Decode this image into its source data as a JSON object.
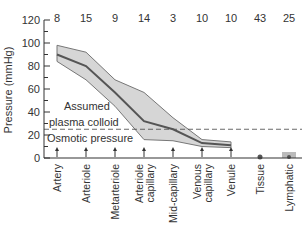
{
  "chart_data": {
    "type": "area",
    "title": "",
    "xlabel": "",
    "ylabel": "Pressure (mmHg)",
    "ylim": [
      0,
      120
    ],
    "yticks": [
      0,
      20,
      40,
      60,
      80,
      100,
      120
    ],
    "grid": false,
    "categories": [
      "Artery",
      "Arteriole",
      "Metarteriole",
      "Arteriole capillary",
      "Mid-capillary",
      "Venous capillary",
      "Venule",
      "Tissue",
      "Lymphatic"
    ],
    "top_labels": [
      "8",
      "15",
      "9",
      "14",
      "3",
      "10",
      "10",
      "43",
      "25"
    ],
    "series": [
      {
        "name": "Upper bound",
        "values": [
          98,
          92,
          68,
          57,
          35,
          16,
          14,
          null,
          null
        ]
      },
      {
        "name": "Mean pressure",
        "values": [
          90,
          80,
          57,
          32,
          25,
          13,
          11,
          0,
          0
        ]
      },
      {
        "name": "Lower bound",
        "values": [
          84,
          68,
          45,
          16,
          15,
          10,
          9,
          null,
          null
        ]
      }
    ],
    "reference_line": {
      "value": 25,
      "style": "dashed",
      "label_above": "Assumed plasma colloid",
      "label_below": "Osmotic pressure"
    },
    "annotations": [
      "Assumed",
      "plasma colloid",
      "Osmotic pressure"
    ]
  },
  "labels": {
    "ylabel": "Pressure (mmHg)",
    "annot1": "Assumed",
    "annot2": "plasma colloid",
    "annot3": "Osmotic pressure"
  },
  "colors": {
    "band": "#d6d6d6",
    "line": "#555555",
    "axis": "#333333"
  }
}
